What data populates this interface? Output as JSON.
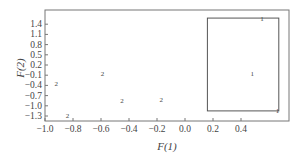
{
  "chart_data": {
    "type": "scatter",
    "title": "",
    "xlabel": "F(1)",
    "ylabel": "F(2)",
    "xlim": [
      -1.0,
      0.7
    ],
    "ylim": [
      -1.4,
      1.7
    ],
    "grid": false,
    "legend": null,
    "x_ticks": [
      "-1.0",
      "-0.8",
      "-0.6",
      "-0.4",
      "-0.2",
      "0.0",
      "0.2",
      "0.4"
    ],
    "y_ticks": [
      "1.4",
      "1.1",
      "0.8",
      "0.5",
      "0.2",
      "-0.1",
      "-0.4",
      "-0.7",
      "-1.0",
      "-1.3"
    ],
    "series": [
      {
        "name": "Group 1",
        "marker": "1",
        "points": [
          {
            "x": 0.48,
            "y": -0.05
          },
          {
            "x": 0.55,
            "y": 1.58
          },
          {
            "x": 0.66,
            "y": -1.15
          }
        ]
      },
      {
        "name": "Group 2",
        "marker": "2",
        "points": [
          {
            "x": -0.92,
            "y": -0.35
          },
          {
            "x": -0.59,
            "y": -0.05
          },
          {
            "x": -0.45,
            "y": -0.85
          },
          {
            "x": -0.17,
            "y": -0.8
          },
          {
            "x": -0.84,
            "y": -1.28
          }
        ]
      }
    ],
    "annotations": [
      {
        "type": "rectangle",
        "label": "group-1-boundary",
        "x0": 0.16,
        "x1": 0.67,
        "y0": -1.15,
        "y1": 1.58
      }
    ]
  }
}
